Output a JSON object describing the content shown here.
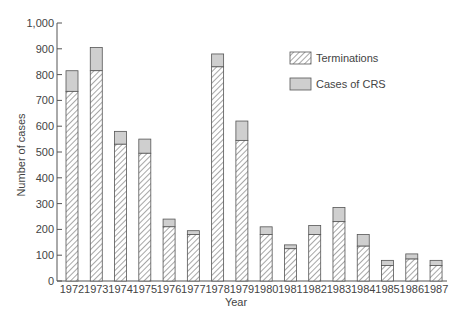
{
  "chart_data": {
    "type": "bar",
    "stacked": true,
    "title": "",
    "xlabel": "Year",
    "ylabel": "Number of cases",
    "ylim": [
      0,
      1000
    ],
    "yticks": [
      0,
      100,
      200,
      300,
      400,
      500,
      600,
      700,
      800,
      900,
      1000
    ],
    "ytick_labels": [
      "0",
      "100",
      "200",
      "300",
      "400",
      "500",
      "600",
      "700",
      "800",
      "900",
      "1,000"
    ],
    "grid": false,
    "legend_position": "upper right",
    "categories": [
      "1972",
      "1973",
      "1974",
      "1975",
      "1976",
      "1977",
      "1978",
      "1979",
      "1980",
      "1981",
      "1982",
      "1983",
      "1984",
      "1985",
      "1986",
      "1987"
    ],
    "series": [
      {
        "name": "Terminations",
        "pattern": "hatched",
        "values": [
          735,
          815,
          530,
          495,
          210,
          180,
          830,
          545,
          180,
          125,
          180,
          230,
          135,
          60,
          85,
          60
        ]
      },
      {
        "name": "Cases of CRS",
        "pattern": "gray-fill",
        "values": [
          80,
          90,
          50,
          55,
          30,
          15,
          50,
          75,
          30,
          15,
          35,
          55,
          45,
          20,
          20,
          20
        ]
      }
    ],
    "totals": [
      815,
      905,
      580,
      550,
      240,
      195,
      880,
      620,
      210,
      140,
      215,
      285,
      180,
      80,
      105,
      80
    ]
  },
  "colors": {
    "axis": "#555555",
    "bar_outline": "#555555",
    "hatch": "#777777",
    "crs_fill": "#cfcfcf",
    "text": "#444444"
  }
}
